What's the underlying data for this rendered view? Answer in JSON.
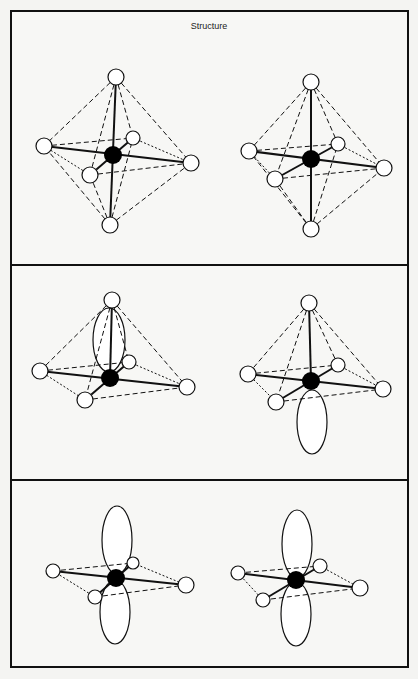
{
  "title": "Structure",
  "panels": [
    {
      "name": "octahedral",
      "description": "Octahedral coordination (6 ligands)"
    },
    {
      "name": "square-pyramidal-with-lone-pair",
      "description": "Square pyramidal with one lone pair lobe"
    },
    {
      "name": "square-planar-with-two-lone-pairs",
      "description": "Square planar with two lone pair lobes"
    }
  ],
  "colors": {
    "line": "#111111",
    "atom_fill": "#ffffff",
    "center_fill": "#000000",
    "background": "#f7f7f5"
  }
}
